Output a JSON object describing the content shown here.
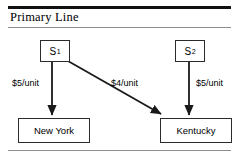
{
  "header": {
    "title": "Primary Line"
  },
  "diagram": {
    "type": "flow-network",
    "nodes": [
      {
        "id": "s1",
        "label": "S",
        "subscript": "1",
        "role": "source"
      },
      {
        "id": "s2",
        "label": "S",
        "subscript": "2",
        "role": "source"
      },
      {
        "id": "ny",
        "label": "New York",
        "role": "destination"
      },
      {
        "id": "ky",
        "label": "Kentucky",
        "role": "destination"
      }
    ],
    "edges": [
      {
        "from": "s1",
        "to": "ny",
        "cost": "$5/unit"
      },
      {
        "from": "s1",
        "to": "ky",
        "cost": "$4/unit"
      },
      {
        "from": "s2",
        "to": "ky",
        "cost": "$5/unit"
      }
    ]
  },
  "colors": {
    "rule_thick": "#111111",
    "rule_thin": "#8d8d8d",
    "stroke": "#2b2b2b",
    "text": "#000000",
    "background": "#ffffff"
  }
}
